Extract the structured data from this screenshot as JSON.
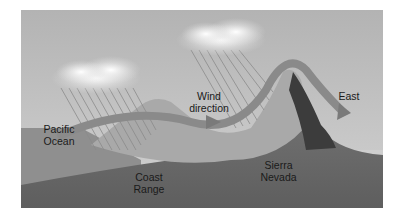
{
  "diagram": {
    "title": "",
    "labels": {
      "pacific_line1": "Pacific",
      "pacific_line2": "Ocean",
      "wind_line1": "Wind",
      "wind_line2": "direction",
      "east": "East",
      "coast_line1": "Coast",
      "coast_line2": "Range",
      "sierra_line1": "Sierra",
      "sierra_line2": "Nevada"
    },
    "colors": {
      "sky": "#bdbdbd",
      "ocean": "#8e8e8e",
      "ground": "#6e6e6e",
      "arrow": "#8a8a8a",
      "cloud": "#f2f2f2"
    }
  }
}
